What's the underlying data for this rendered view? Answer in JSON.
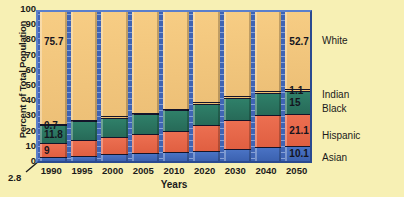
{
  "chart_data": {
    "type": "area",
    "title": "",
    "xlabel": "Years",
    "ylabel": "Percent of Total Population",
    "ylim": [
      0,
      100
    ],
    "ytick_labels": [
      "100",
      "90",
      "80",
      "70",
      "60",
      "50",
      "40",
      "30",
      "20",
      "10",
      "0"
    ],
    "ytick_values": [
      100,
      90,
      80,
      70,
      60,
      50,
      40,
      30,
      20,
      10,
      0
    ],
    "grid": false,
    "legend_position": "right",
    "stacking": "percent",
    "categories": [
      "1990",
      "1995",
      "2000",
      "2005",
      "2010",
      "2020",
      "2030",
      "2040",
      "2050"
    ],
    "series": [
      {
        "name": "Asian",
        "color": "#4a73c4",
        "values": [
          2.8,
          3.6,
          4.3,
          5.0,
          5.7,
          6.9,
          8.0,
          9.1,
          10.1
        ]
      },
      {
        "name": "Hispanic",
        "color": "#ec6f51",
        "values": [
          9.0,
          10.4,
          11.7,
          13.0,
          14.3,
          16.8,
          19.2,
          21.0,
          21.1
        ]
      },
      {
        "name": "Black",
        "color": "#2f8069",
        "values": [
          11.8,
          12.2,
          12.6,
          13.0,
          13.3,
          13.9,
          14.3,
          14.7,
          15.0
        ]
      },
      {
        "name": "Indian",
        "color": "#f3c478",
        "values": [
          0.7,
          0.75,
          0.8,
          0.85,
          0.9,
          0.95,
          1.0,
          1.05,
          1.1
        ]
      },
      {
        "name": "White",
        "color": "#f7cd84",
        "values": [
          75.7,
          73.05,
          70.6,
          68.15,
          65.8,
          61.45,
          57.5,
          54.15,
          52.7
        ]
      }
    ],
    "annotations": {
      "below_axis_value": "2.8",
      "first_column_labels": {
        "white": "75.7",
        "indian": "0.7",
        "black": "11.8",
        "hispanic": "9"
      },
      "last_column_labels": {
        "white": "52.7",
        "indian": "1.1",
        "black": "15",
        "hispanic": "21.1",
        "asian": "10.1"
      }
    },
    "legend_entries": [
      {
        "label": "White",
        "color": "#f7cd84"
      },
      {
        "label": "Indian",
        "color": "#f3c478"
      },
      {
        "label": "Black",
        "color": "#2f8069"
      },
      {
        "label": "Hispanic",
        "color": "#ec6f51"
      },
      {
        "label": "Asian",
        "color": "#4a73c4"
      }
    ]
  },
  "axis": {
    "y_title": "Percent of Total Population",
    "x_title": "Years",
    "y_ticks": [
      "100",
      "90",
      "80",
      "70",
      "60",
      "50",
      "40",
      "30",
      "20",
      "10",
      "0"
    ],
    "x_ticks": [
      "1990",
      "1995",
      "2000",
      "2005",
      "2010",
      "2020",
      "2030",
      "2040",
      "2050"
    ],
    "below_axis": "2.8"
  },
  "labels": {
    "l_white": "75.7",
    "l_indian": "0.7",
    "l_black": "11.8",
    "l_hispanic": "9",
    "r_white": "52.7",
    "r_indian": "1.1",
    "r_black": "15",
    "r_hispanic": "21.1",
    "r_asian": "10.1"
  },
  "legend": {
    "white": "White",
    "indian": "Indian",
    "black": "Black",
    "hispanic": "Hispanic",
    "asian": "Asian"
  },
  "colors": {
    "background": "#f7f0b4",
    "plot_field": "#3f64b4",
    "white_band": "#f7cd84",
    "indian_band": "#f3c478",
    "black_band": "#2f8069",
    "hispanic_band": "#ec6f51",
    "asian_band": "#4a73c4"
  }
}
